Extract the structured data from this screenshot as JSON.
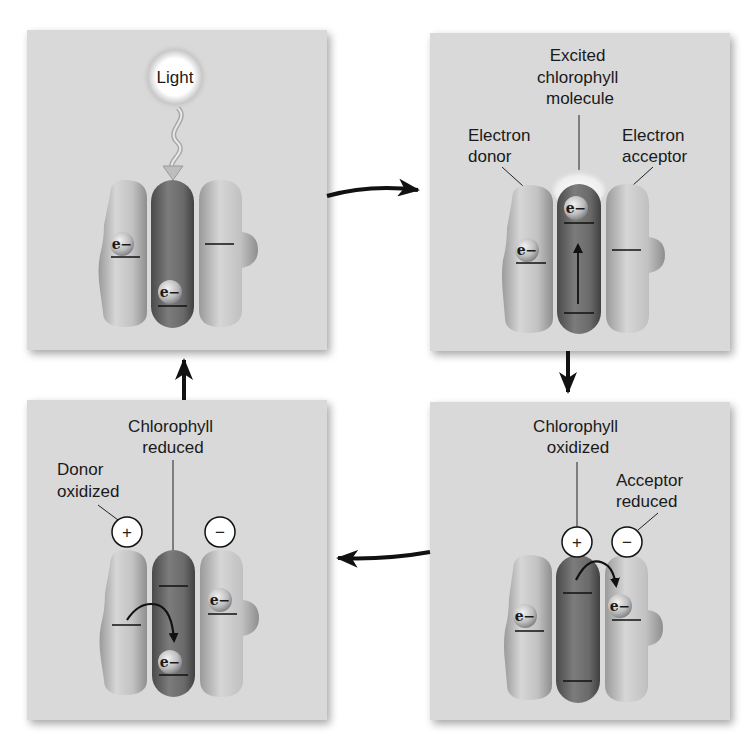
{
  "colors": {
    "background": "#ffffff",
    "panel": "#d9d9d9",
    "panel_shadow": "#bdbdbd",
    "molecule_light": "#c4c4c4",
    "molecule_dark": "#6e6e6e",
    "arrow": "#111111",
    "text": "#1a1a1a"
  },
  "panels": [
    {
      "id": "panel-1",
      "position": "top-left",
      "labels": {
        "light": "Light"
      },
      "electron_symbol": "e−"
    },
    {
      "id": "panel-2",
      "position": "top-right",
      "labels": {
        "excited": [
          "Excited",
          "chlorophyll",
          "molecule"
        ],
        "donor": [
          "Electron",
          "donor"
        ],
        "acceptor": [
          "Electron",
          "acceptor"
        ]
      },
      "electron_symbol": "e−"
    },
    {
      "id": "panel-3",
      "position": "bottom-right",
      "labels": {
        "chlorophyll": [
          "Chlorophyll",
          "oxidized"
        ],
        "acceptor": [
          "Acceptor",
          "reduced"
        ]
      },
      "charges": [
        "+",
        "−"
      ],
      "electron_symbol": "e−"
    },
    {
      "id": "panel-4",
      "position": "bottom-left",
      "labels": {
        "chlorophyll": [
          "Chlorophyll",
          "reduced"
        ],
        "donor": [
          "Donor",
          "oxidized"
        ]
      },
      "charges": [
        "+",
        "−"
      ],
      "electron_symbol": "e−"
    }
  ],
  "cycle_arrows": [
    {
      "from": "panel-1",
      "to": "panel-2",
      "direction": "right"
    },
    {
      "from": "panel-2",
      "to": "panel-3",
      "direction": "down"
    },
    {
      "from": "panel-3",
      "to": "panel-4",
      "direction": "left"
    },
    {
      "from": "panel-4",
      "to": "panel-1",
      "direction": "up"
    }
  ]
}
